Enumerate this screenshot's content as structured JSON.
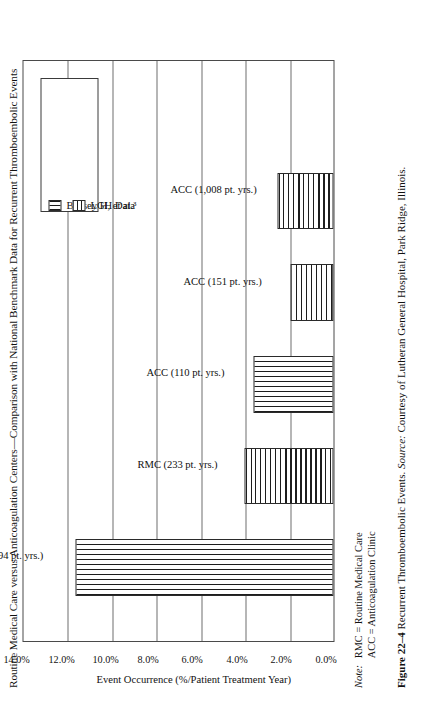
{
  "figure": {
    "title": "Routine Medical Care versus Anticoagulation Centers—Comparison with National Benchmark Data for Recurrent Thromboembolic Events",
    "note_label": "Note:",
    "note_lines": [
      "RMC = Routine Medical Care",
      "ACC = Anticoagulation Clinic"
    ],
    "caption_number": "Figure 22–4",
    "caption_text": "Recurrent Thromboembolic Events.",
    "caption_source_label": "Source:",
    "caption_source_text": "Courtesy of Lutheran General Hospital, Park Ridge, Illinois."
  },
  "chart_data": {
    "type": "bar",
    "orientation": "vertical",
    "title": "Routine Medical Care versus Anticoagulation Centers—Comparison with National Benchmark Data for Recurrent Thromboembolic Events",
    "xlabel": "",
    "ylabel": "Event Occurrence (%/Patient Treatment Year)",
    "ylim": [
      0.0,
      14.0
    ],
    "ytick_labels": [
      "0.0%",
      "2.0%",
      "4.0%",
      "6.0%",
      "8.0%",
      "10.0%",
      "12.0%",
      "14.0%"
    ],
    "ytick_values": [
      0.0,
      2.0,
      4.0,
      6.0,
      8.0,
      10.0,
      12.0,
      14.0
    ],
    "grid": true,
    "categories": [
      "RMC (94 pt. yrs.)",
      "RMC (233 pt. yrs.)",
      "ACC (110 pt. yrs.)",
      "ACC (151 pt. yrs.)",
      "ACC (1,008 pt. yrs.)"
    ],
    "values": [
      11.6,
      4.0,
      3.6,
      1.95,
      2.5
    ],
    "point_series": [
      "Bussey H, et al.3",
      "LGH Data",
      "Bussey H, et al.3",
      "LGH Data",
      "LGH Data"
    ],
    "legend": {
      "position": "upper right",
      "entries": [
        {
          "label": "Bussey H, et al.³",
          "pattern": "vertical-stripes"
        },
        {
          "label": "LGH Data",
          "pattern": "horizontal-stripes"
        }
      ]
    }
  }
}
